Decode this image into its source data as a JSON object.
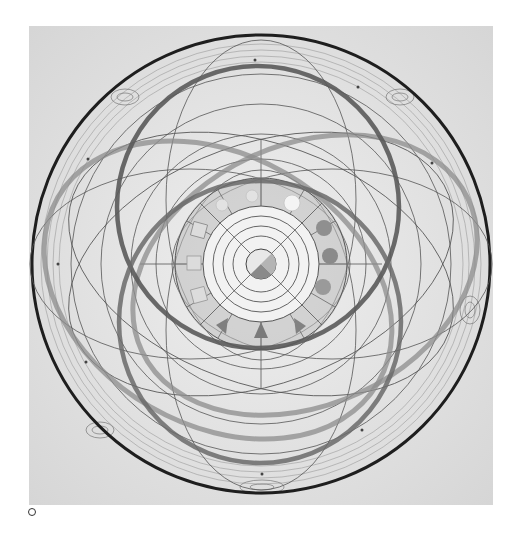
{
  "figure": {
    "kind": "hand-drawn cosmological diagram",
    "paper_color": "#e4e4e4",
    "ink_color": "#2a2a2a",
    "center": [
      261,
      264
    ],
    "outer_circle": {
      "cx": 261,
      "cy": 264,
      "r": 229,
      "stroke": "#1e1e1e",
      "width": 3
    },
    "thick_rings": [
      {
        "name": "upper-ring",
        "cx": 258,
        "cy": 207,
        "r": 141
      },
      {
        "name": "lower-ring",
        "cx": 260,
        "cy": 322,
        "r": 141
      }
    ],
    "tilted_ellipses": [
      {
        "name": "left-ellipse",
        "cx": 218,
        "cy": 290,
        "rx": 185,
        "ry": 135,
        "rotate": 30
      },
      {
        "name": "right-ellipse",
        "cx": 305,
        "cy": 275,
        "rx": 180,
        "ry": 130,
        "rotate": -25
      }
    ],
    "core": {
      "rings": [
        15,
        28,
        38,
        48,
        58
      ],
      "segment_ring": {
        "inner": 58,
        "outer": 86,
        "segments": 12
      },
      "symbols": {
        "east": [
          "filled-circle",
          "filled-circle",
          "filled-circle"
        ],
        "south": [
          "triangle",
          "triangle",
          "triangle"
        ],
        "west": [
          "square",
          "square",
          "square"
        ],
        "north": [
          "light-circle",
          "light-shape",
          "light-shape"
        ]
      }
    }
  },
  "marker": {
    "label": "o"
  }
}
